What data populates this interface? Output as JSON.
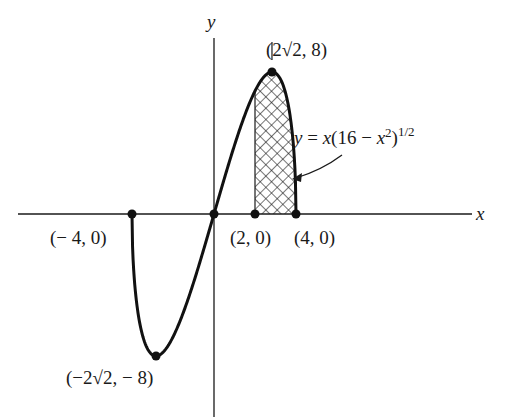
{
  "chart_data": {
    "type": "line",
    "title": "",
    "function": "y = x(16 - x^2)^(1/2)",
    "xlabel": "x",
    "ylabel": "y",
    "xlim": [
      -4,
      4
    ],
    "ylim": [
      -8,
      8
    ],
    "grid": false,
    "shaded_region": {
      "x_from": 2,
      "x_to": 4,
      "pattern": "crosshatch"
    },
    "series": [
      {
        "name": "y = x(16 - x^2)^(1/2)",
        "x": [
          -4,
          -3.5,
          -3,
          -2.828,
          -2.5,
          -2,
          -1.5,
          -1,
          -0.5,
          0,
          0.5,
          1,
          1.5,
          2,
          2.5,
          2.828,
          3,
          3.5,
          4
        ],
        "y": [
          0,
          -6.78,
          -7.94,
          -8,
          -7.81,
          -6.93,
          -5.56,
          -3.87,
          -1.98,
          0,
          1.98,
          3.87,
          5.56,
          6.93,
          7.81,
          8,
          7.94,
          6.78,
          0
        ]
      }
    ],
    "points": [
      {
        "x": -4,
        "y": 0,
        "label": "(− 4, 0)"
      },
      {
        "x": 0,
        "y": 0,
        "label": ""
      },
      {
        "x": 2,
        "y": 0,
        "label": "(2, 0)"
      },
      {
        "x": 4,
        "y": 0,
        "label": "(4, 0)"
      },
      {
        "x": 2.828,
        "y": 8,
        "label": "(2√2, 8)"
      },
      {
        "x": -2.828,
        "y": -8,
        "label": "(−2√2, − 8)"
      }
    ],
    "annotations": {
      "equation_lhs": "y",
      "equation_mid": " = ",
      "equation_x": "x",
      "equation_open": "(16 − ",
      "equation_x2": "x",
      "equation_sq": "2",
      "equation_close": ")",
      "equation_exp": "1/2"
    }
  }
}
